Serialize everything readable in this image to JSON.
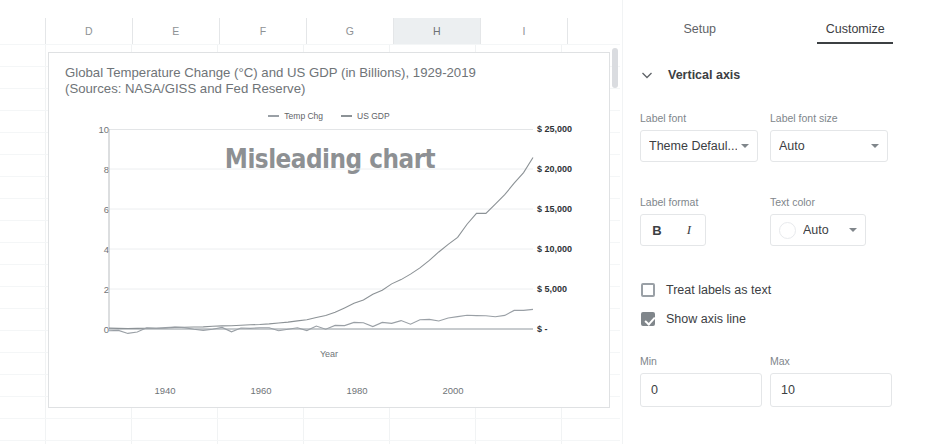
{
  "spreadsheet": {
    "columns": [
      {
        "label": "D",
        "selected": false
      },
      {
        "label": "E",
        "selected": false
      },
      {
        "label": "F",
        "selected": false
      },
      {
        "label": "G",
        "selected": false
      },
      {
        "label": "H",
        "selected": true
      },
      {
        "label": "I",
        "selected": false
      }
    ]
  },
  "chart_data": {
    "type": "line",
    "title": "Global Temperature Change (°C) and US GDP (in Billions), 1929-2019\n(Sources: NASA/GISS and Fed Reserve)",
    "title_line1": "Global Temperature Change (°C) and US GDP (in Billions), 1929-2019",
    "title_line2": "(Sources: NASA/GISS and Fed Reserve)",
    "watermark": "Misleading chart",
    "xlabel": "Year",
    "ylabel": "",
    "grid": true,
    "legend_position": "top",
    "legend": [
      "Temp Chg",
      "US GDP"
    ],
    "xlim": [
      1929,
      2019
    ],
    "xticks": [
      "1940",
      "1960",
      "1980",
      "2000"
    ],
    "xtick_values": [
      1940,
      1960,
      1980,
      2000
    ],
    "left_axis": {
      "name": "Temp Chg",
      "ylim": [
        0,
        10
      ],
      "ticks": [
        "0",
        "2",
        "4",
        "6",
        "8",
        "10"
      ],
      "tick_values": [
        0,
        2,
        4,
        6,
        8,
        10
      ]
    },
    "right_axis": {
      "name": "US GDP",
      "ylim": [
        0,
        25000
      ],
      "ticks": [
        "$ -",
        "$ 5,000",
        "$ 10,000",
        "$ 15,000",
        "$ 20,000",
        "$ 25,000"
      ],
      "tick_values": [
        0,
        5000,
        10000,
        15000,
        20000,
        25000
      ]
    },
    "colors": {
      "temp_chg": "#9aa0a6",
      "us_gdp": "#8c9296",
      "watermark": "#8d9093"
    },
    "x": [
      1929,
      1931,
      1933,
      1935,
      1937,
      1939,
      1941,
      1943,
      1945,
      1947,
      1949,
      1951,
      1953,
      1955,
      1957,
      1959,
      1961,
      1963,
      1965,
      1967,
      1969,
      1971,
      1973,
      1975,
      1977,
      1979,
      1981,
      1983,
      1985,
      1987,
      1989,
      1991,
      1993,
      1995,
      1997,
      1999,
      2001,
      2003,
      2005,
      2007,
      2009,
      2011,
      2013,
      2015,
      2017,
      2019
    ],
    "series": [
      {
        "name": "Temp Chg",
        "axis": "left",
        "unit": "°C",
        "values": [
          -0.09,
          -0.07,
          -0.22,
          -0.15,
          0.06,
          0.03,
          0.07,
          0.1,
          0.07,
          -0.01,
          -0.07,
          -0.01,
          0.08,
          -0.14,
          0.05,
          0.03,
          0.06,
          0.06,
          -0.09,
          -0.01,
          0.06,
          -0.08,
          0.15,
          -0.01,
          0.18,
          0.17,
          0.33,
          0.31,
          0.12,
          0.33,
          0.28,
          0.42,
          0.24,
          0.46,
          0.48,
          0.4,
          0.55,
          0.62,
          0.69,
          0.67,
          0.66,
          0.61,
          0.68,
          0.93,
          0.93,
          0.98
        ]
      },
      {
        "name": "US GDP",
        "axis": "right",
        "unit": "billions USD",
        "values": [
          105,
          77,
          57,
          74,
          92,
          93,
          127,
          203,
          228,
          250,
          268,
          340,
          389,
          415,
          474,
          522,
          563,
          638,
          744,
          862,
          1018,
          1164,
          1428,
          1685,
          2081,
          2632,
          3207,
          3635,
          4339,
          4855,
          5642,
          6174,
          6858,
          7640,
          8578,
          9631,
          10582,
          11458,
          13094,
          14452,
          14449,
          15600,
          16785,
          18225,
          19543,
          21433
        ]
      }
    ]
  },
  "panel": {
    "tabs": [
      {
        "label": "Setup",
        "active": false
      },
      {
        "label": "Customize",
        "active": true
      }
    ],
    "section_title": "Vertical axis",
    "fields": {
      "label_font": {
        "label": "Label font",
        "value": "Theme Defaul..."
      },
      "label_font_size": {
        "label": "Label font size",
        "value": "Auto"
      },
      "label_format": {
        "label": "Label format",
        "bold": "B",
        "italic": "I"
      },
      "text_color": {
        "label": "Text color",
        "value": "Auto",
        "swatch": "#ffffff"
      },
      "min": {
        "label": "Min",
        "value": "0"
      },
      "max": {
        "label": "Max",
        "value": "10"
      }
    },
    "checkboxes": [
      {
        "label": "Treat labels as text",
        "checked": false
      },
      {
        "label": "Show axis line",
        "checked": true
      }
    ]
  }
}
